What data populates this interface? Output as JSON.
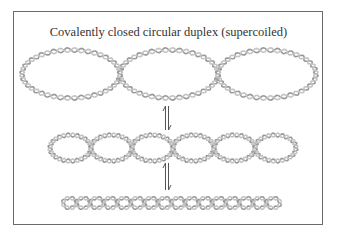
{
  "title": "Covalently closed circular duplex (supercoiled)",
  "colors": {
    "strand": "#9a9a9a",
    "strand_light": "#c4c4c4",
    "frame": "#6a6a6a",
    "text": "#333333",
    "arrow": "#555555"
  },
  "structures": [
    {
      "name": "loosely-supercoiled-duplex",
      "loops": 3
    },
    {
      "name": "intermediate-supercoiled-duplex",
      "loops": 6
    },
    {
      "name": "tightly-supercoiled-duplex",
      "loops": 16
    }
  ],
  "equilibria": [
    {
      "name": "equilibrium-arrows-1",
      "symbol": "⇌"
    },
    {
      "name": "equilibrium-arrows-2",
      "symbol": "⇌"
    }
  ]
}
